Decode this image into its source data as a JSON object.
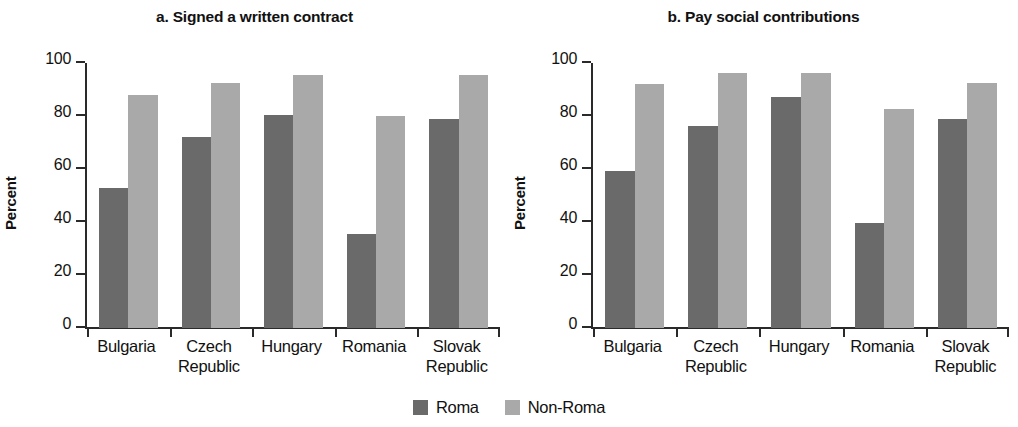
{
  "figure": {
    "ylabel": "Percent",
    "legend": [
      {
        "label": "Roma",
        "color": "#6a6a6a"
      },
      {
        "label": "Non-Roma",
        "color": "#a9a9a9"
      }
    ]
  },
  "chart_data": [
    {
      "type": "bar",
      "title": "a. Signed a written contract",
      "xlabel": "",
      "ylabel": "Percent",
      "ylim": [
        0,
        100
      ],
      "yticks": [
        0,
        20,
        40,
        60,
        80,
        100
      ],
      "grid": false,
      "legend_position": "bottom-center",
      "categories": [
        "Bulgaria",
        "Czech Republic",
        "Hungary",
        "Romania",
        "Slovak Republic"
      ],
      "series": [
        {
          "name": "Roma",
          "color": "#6a6a6a",
          "values": [
            53.0,
            72.0,
            80.5,
            35.5,
            78.8
          ]
        },
        {
          "name": "Non-Roma",
          "color": "#a9a9a9",
          "values": [
            88.0,
            92.3,
            95.3,
            80.0,
            95.5
          ]
        }
      ]
    },
    {
      "type": "bar",
      "title": "b. Pay social contributions",
      "xlabel": "",
      "ylabel": "Percent",
      "ylim": [
        0,
        100
      ],
      "yticks": [
        0,
        20,
        40,
        60,
        80,
        100
      ],
      "grid": false,
      "legend_position": "bottom-center",
      "categories": [
        "Bulgaria",
        "Czech Republic",
        "Hungary",
        "Romania",
        "Slovak Republic"
      ],
      "series": [
        {
          "name": "Roma",
          "color": "#6a6a6a",
          "values": [
            59.3,
            76.3,
            87.3,
            39.5,
            78.8
          ]
        },
        {
          "name": "Non-Roma",
          "color": "#a9a9a9",
          "values": [
            92.0,
            96.3,
            96.3,
            82.5,
            92.5
          ]
        }
      ]
    }
  ]
}
